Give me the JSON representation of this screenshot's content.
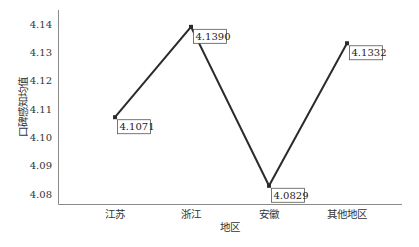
{
  "chart_data": {
    "type": "line",
    "title": "",
    "xlabel": "地区",
    "ylabel": "口碑感知均值",
    "categories": [
      "江苏",
      "浙江",
      "安徽",
      "其他地区"
    ],
    "values": [
      4.1071,
      4.139,
      4.0829,
      4.1332
    ],
    "data_labels": [
      "4.1071",
      "4.1390",
      "4.0829",
      "4.1332"
    ],
    "yticks": [
      "4.08",
      "4.09",
      "4.10",
      "4.11",
      "4.12",
      "4.13",
      "4.14"
    ],
    "ylim": [
      4.08,
      4.14
    ],
    "grid": false,
    "legend": "none",
    "colors": {
      "line": "#2b2b2b",
      "axis": "#888888",
      "label_border": "#555555"
    }
  }
}
